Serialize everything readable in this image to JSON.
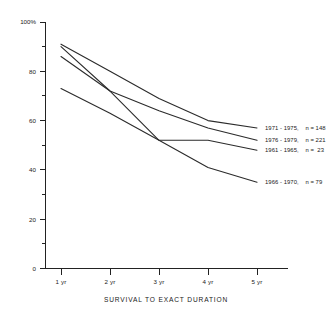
{
  "chart_data": {
    "type": "line",
    "title": "",
    "xlabel": "SURVIVAL TO EXACT DURATION",
    "ylabel": "",
    "categories": [
      "1 yr",
      "2 yr",
      "3 yr",
      "4 yr",
      "5 yr"
    ],
    "ylim": [
      0,
      100
    ],
    "xlim_categories": 5,
    "grid": false,
    "legend_position": "right-inline-end-of-line",
    "y_ticks_major": [
      "0",
      "20",
      "40",
      "60",
      "80",
      "100%"
    ],
    "y_tick_values_major": [
      0,
      20,
      40,
      60,
      80,
      100
    ],
    "y_tick_values_minor": [
      10,
      30,
      50,
      70,
      90
    ],
    "series": [
      {
        "name": "1971 - 1975",
        "n": 148,
        "label": "1971 - 1975,    n = 148",
        "values": [
          91,
          80,
          69,
          60,
          57
        ]
      },
      {
        "name": "1976 - 1979",
        "n": 221,
        "label": "1976 - 1979,    n = 221",
        "values": [
          90,
          72,
          64,
          57,
          52
        ]
      },
      {
        "name": "1961 - 1965",
        "n": 23,
        "label": "1961 - 1965,    n =  23",
        "values": [
          86,
          72,
          52,
          52,
          48
        ]
      },
      {
        "name": "1966 - 1970",
        "n": 79,
        "label": "1966 - 1970,    n = 79",
        "values": [
          73,
          63,
          52,
          41,
          35
        ]
      }
    ],
    "colors": {
      "line": "#2b2b2b",
      "axis": "#222222",
      "text": "#1a1a1a",
      "background": "#ffffff"
    }
  }
}
